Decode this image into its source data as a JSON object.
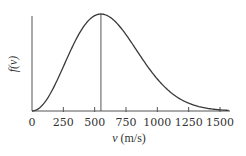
{
  "chart_data": {
    "type": "line",
    "title": "",
    "xlabel": "v (m/s)",
    "xlabel_var": "v",
    "xlabel_unit": "(m/s)",
    "ylabel": "f(v)",
    "xlim": [
      0,
      1570
    ],
    "ylim": [
      0,
      1
    ],
    "x_ticks": [
      0,
      250,
      500,
      750,
      1000,
      1250,
      1500
    ],
    "x_tick_labels": [
      "0",
      "250",
      "500",
      "750",
      "1000",
      "1250",
      "1500"
    ],
    "y_ticks": [],
    "grid": false,
    "legend": null,
    "annotations": [
      {
        "type": "vertical-line",
        "x": 550,
        "label": "most probable speed (peak)"
      }
    ],
    "peak_v": 550,
    "series": [
      {
        "name": "f(v)",
        "description": "Maxwell-Boltzmann speed distribution (relative units)",
        "x": [
          0,
          50,
          100,
          150,
          200,
          250,
          300,
          350,
          400,
          450,
          500,
          550,
          600,
          650,
          700,
          750,
          800,
          850,
          900,
          950,
          1000,
          1050,
          1100,
          1150,
          1200,
          1250,
          1300,
          1350,
          1400,
          1450,
          1500,
          1550
        ],
        "values": [
          0.0,
          0.022,
          0.088,
          0.192,
          0.325,
          0.474,
          0.627,
          0.769,
          0.885,
          0.962,
          0.992,
          1.0,
          0.974,
          0.923,
          0.849,
          0.76,
          0.662,
          0.561,
          0.464,
          0.373,
          0.293,
          0.224,
          0.166,
          0.121,
          0.085,
          0.058,
          0.039,
          0.025,
          0.016,
          0.01,
          0.006,
          0.004
        ]
      }
    ]
  },
  "colors": {
    "axis": "#555555",
    "curve": "#3a3a3a",
    "text": "#333333"
  }
}
